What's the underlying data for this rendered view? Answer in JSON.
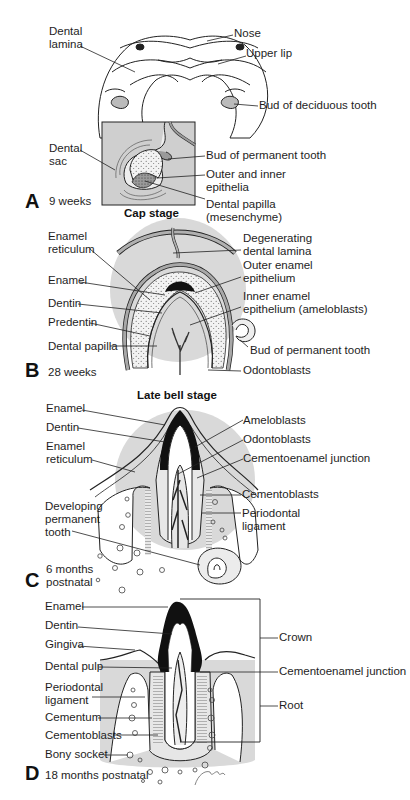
{
  "figure": {
    "type": "diagram",
    "colors": {
      "tissue_fill": "#d9d9d9",
      "outline": "#222222",
      "enamel": "#111111",
      "background": "#ffffff"
    },
    "panels": [
      {
        "letter": "A",
        "age": "9 weeks",
        "stage": "Cap stage",
        "labels": [
          "Dental\nlamina",
          "Nose",
          "Upper lip",
          "Bud of deciduous tooth",
          "Dental\nsac",
          "Bud of permanent tooth",
          "Outer and inner\nepithelia",
          "Dental papilla\n(mesenchyme)"
        ]
      },
      {
        "letter": "B",
        "age": "28 weeks",
        "stage": "Late bell stage",
        "labels": [
          "Enamel\nreticulum",
          "Degenerating\ndental lamina",
          "Outer enamel\nepithelium",
          "Enamel",
          "Inner enamel\nepithelium (ameloblasts)",
          "Dentin",
          "Predentin",
          "Dental papilla",
          "Bud of permanent tooth",
          "Odontoblasts"
        ]
      },
      {
        "letter": "C",
        "age": "6 months\npostnatal",
        "stage": "",
        "labels": [
          "Enamel",
          "Ameloblasts",
          "Dentin",
          "Odontoblasts",
          "Enamel\nreticulum",
          "Cementoenamel junction",
          "Cementoblasts",
          "Developing\npermanent\ntooth",
          "Periodontal\nligament"
        ]
      },
      {
        "letter": "D",
        "age": "18 months postnatal",
        "stage": "",
        "labels": [
          "Enamel",
          "Dentin",
          "Crown",
          "Gingiva",
          "Dental pulp",
          "Cementoenamel junction",
          "Periodontal\nligament",
          "Root",
          "Cementum",
          "Cementoblasts",
          "Bony socket"
        ]
      }
    ]
  },
  "a": {
    "letter": "A",
    "age": "9 weeks",
    "stage": "Cap stage",
    "dental_lamina": "Dental\nlamina",
    "nose": "Nose",
    "upper_lip": "Upper lip",
    "bud_deciduous": "Bud of deciduous tooth",
    "dental_sac": "Dental\nsac",
    "bud_permanent": "Bud of permanent tooth",
    "outer_inner": "Outer and inner\nepithelia",
    "dental_papilla": "Dental papilla\n(mesenchyme)"
  },
  "b": {
    "letter": "B",
    "age": "28 weeks",
    "stage": "Late bell stage",
    "enamel_reticulum": "Enamel\nreticulum",
    "degenerating": "Degenerating\ndental lamina",
    "outer_enamel": "Outer enamel\nepithelium",
    "enamel": "Enamel",
    "inner_enamel": "Inner enamel\nepithelium (ameloblasts)",
    "dentin": "Dentin",
    "predentin": "Predentin",
    "dental_papilla": "Dental papilla",
    "bud_permanent": "Bud of permanent tooth",
    "odontoblasts": "Odontoblasts"
  },
  "c": {
    "letter": "C",
    "age": "6 months\npostnatal",
    "enamel": "Enamel",
    "ameloblasts": "Ameloblasts",
    "dentin": "Dentin",
    "odontoblasts": "Odontoblasts",
    "enamel_reticulum": "Enamel\nreticulum",
    "cej": "Cementoenamel junction",
    "cementoblasts": "Cementoblasts",
    "developing": "Developing\npermanent\ntooth",
    "periodontal": "Periodontal\nligament"
  },
  "d": {
    "letter": "D",
    "age": "18 months postnatal",
    "enamel": "Enamel",
    "dentin": "Dentin",
    "crown": "Crown",
    "gingiva": "Gingiva",
    "dental_pulp": "Dental pulp",
    "cej": "Cementoenamel junction",
    "periodontal": "Periodontal\nligament",
    "root": "Root",
    "cementum": "Cementum",
    "cementoblasts": "Cementoblasts",
    "bony_socket": "Bony socket"
  }
}
